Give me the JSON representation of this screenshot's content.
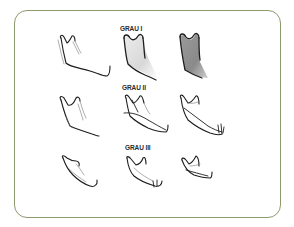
{
  "figure": {
    "frame_color": "#8c9a6e",
    "rows": [
      {
        "label": "GRAU I",
        "items": [
          "mandible-sketch-outline",
          "mandible-sketch-light-shading",
          "mandible-sketch-dark-shading"
        ]
      },
      {
        "label": "GRAU II",
        "items": [
          "mandible-sketch-outline",
          "mandible-sketch-resorbed",
          "mandible-sketch-resorbed"
        ]
      },
      {
        "label": "GRAU III",
        "items": [
          "mandible-sketch-outline",
          "mandible-sketch-resorbed",
          "mandible-sketch-resorbed"
        ]
      }
    ],
    "shading_colors": {
      "light": "#d9d9d9",
      "dark": "#8d8d8d"
    }
  }
}
